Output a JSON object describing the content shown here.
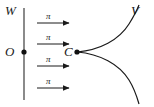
{
  "figure": {
    "type": "geometry-diagram",
    "background_color": "#ffffff",
    "stroke_color": "#1a1a1a",
    "labels": {
      "wavefront_line": "W",
      "origin_point": "O",
      "cusp_point": "C",
      "curve": "V"
    },
    "vertical_line": {
      "name": "W",
      "x": 24,
      "y_top": 8,
      "y_bottom": 100
    },
    "points": [
      {
        "name": "O",
        "label": "O",
        "x": 24,
        "y": 52,
        "radius": 2.6
      },
      {
        "name": "C",
        "label": "C",
        "x": 77,
        "y": 52,
        "radius": 2.6
      }
    ],
    "arrows": {
      "label": "π",
      "count": 4,
      "direction": "right",
      "x_start": 37,
      "x_end": 69,
      "rows": [
        {
          "label": "π",
          "y": 23,
          "label_x": 48,
          "label_y": 12
        },
        {
          "label": "π",
          "y": 44,
          "label_x": 48,
          "label_y": 33
        },
        {
          "label": "π",
          "y": 66,
          "label_x": 48,
          "label_y": 55
        },
        {
          "label": "π",
          "y": 88,
          "label_x": 48,
          "label_y": 77
        }
      ]
    },
    "curve": {
      "name": "V",
      "shape": "cusp",
      "cusp_at": {
        "x": 77,
        "y": 52
      },
      "upper_branch_path": "M 77 52 C 100 50 119 40 129 24 C 134 16 137 10 139 5",
      "lower_branch_path": "M 77 52 C 100 54 119 64 129 80 C 134 88 137 97 139 104"
    }
  }
}
